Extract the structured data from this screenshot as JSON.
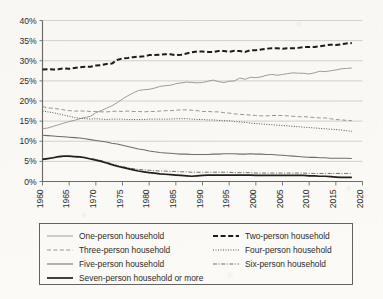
{
  "chart_data": {
    "type": "line",
    "title": "",
    "subtitle": "",
    "xlabel": "",
    "ylabel": "",
    "xlim": [
      1960,
      2020
    ],
    "ylim": [
      0,
      40
    ],
    "grid": true,
    "legend_position": "bottom",
    "y_tick_labels": [
      "0%",
      "5%",
      "10%",
      "15%",
      "20%",
      "25%",
      "30%",
      "35%",
      "40%"
    ],
    "y_tick_values": [
      0,
      5,
      10,
      15,
      20,
      25,
      30,
      35,
      40
    ],
    "x_tick_labels": [
      "1960",
      "1965",
      "1970",
      "1975",
      "1980",
      "1985",
      "1990",
      "1995",
      "2000",
      "2005",
      "2010",
      "2015",
      "2020"
    ],
    "x_tick_values": [
      1960,
      1965,
      1970,
      1975,
      1980,
      1985,
      1990,
      1995,
      2000,
      2005,
      2010,
      2015,
      2020
    ],
    "x": [
      1960,
      1961,
      1962,
      1963,
      1964,
      1965,
      1966,
      1967,
      1968,
      1969,
      1970,
      1971,
      1972,
      1973,
      1974,
      1975,
      1976,
      1977,
      1978,
      1979,
      1980,
      1981,
      1982,
      1983,
      1984,
      1985,
      1986,
      1987,
      1988,
      1989,
      1990,
      1991,
      1992,
      1993,
      1994,
      1995,
      1996,
      1997,
      1998,
      1999,
      2000,
      2001,
      2002,
      2003,
      2004,
      2005,
      2006,
      2007,
      2008,
      2009,
      2010,
      2011,
      2012,
      2013,
      2014,
      2015,
      2016,
      2017,
      2018
    ],
    "series": [
      {
        "name": "One-person household",
        "style": "solid-thin",
        "color": "#8e8c88",
        "values": [
          13.1,
          13.3,
          13.7,
          14.1,
          14.5,
          14.9,
          15.2,
          15.6,
          15.9,
          16.2,
          17.1,
          17.6,
          18.2,
          18.8,
          19.6,
          20.5,
          21.3,
          22.0,
          22.6,
          22.8,
          22.9,
          23.2,
          23.6,
          23.8,
          23.9,
          24.3,
          24.5,
          24.7,
          24.6,
          24.5,
          24.6,
          24.9,
          25.2,
          24.8,
          24.6,
          24.9,
          25.0,
          25.7,
          25.4,
          25.9,
          25.8,
          26.0,
          26.4,
          26.6,
          26.4,
          26.6,
          26.8,
          27.0,
          26.9,
          26.9,
          26.7,
          27.0,
          27.4,
          27.3,
          27.5,
          27.7,
          28.0,
          28.1,
          28.2
        ]
      },
      {
        "name": "Two-person household",
        "style": "dashed-thick",
        "color": "#1e1c1a",
        "values": [
          27.8,
          27.9,
          27.8,
          27.9,
          28.1,
          28.0,
          28.2,
          28.4,
          28.5,
          28.5,
          28.8,
          28.9,
          29.2,
          29.3,
          30.2,
          30.6,
          30.7,
          30.9,
          31.0,
          31.1,
          31.4,
          31.4,
          31.5,
          31.6,
          31.6,
          31.4,
          31.5,
          31.8,
          32.1,
          32.3,
          32.3,
          32.2,
          32.2,
          32.4,
          32.4,
          32.2,
          32.5,
          32.4,
          32.2,
          32.6,
          32.6,
          32.8,
          33.0,
          33.1,
          33.1,
          33.0,
          33.1,
          33.1,
          33.2,
          33.4,
          33.4,
          33.4,
          33.6,
          33.8,
          34.0,
          33.9,
          34.1,
          34.3,
          34.4
        ]
      },
      {
        "name": "Three-person household",
        "style": "dashed-thin",
        "color": "#908e8a",
        "values": [
          18.6,
          18.3,
          18.2,
          18.0,
          17.8,
          17.6,
          17.5,
          17.5,
          17.5,
          17.4,
          17.4,
          17.3,
          17.3,
          17.4,
          17.5,
          17.4,
          17.5,
          17.4,
          17.4,
          17.3,
          17.4,
          17.4,
          17.5,
          17.6,
          17.6,
          17.7,
          17.8,
          17.8,
          17.7,
          17.6,
          17.4,
          17.4,
          17.3,
          17.3,
          17.1,
          17.0,
          16.8,
          16.7,
          16.6,
          16.5,
          16.4,
          16.3,
          16.3,
          16.4,
          16.4,
          16.4,
          16.3,
          16.2,
          16.1,
          16.1,
          16.0,
          15.9,
          15.8,
          15.8,
          15.6,
          15.4,
          15.3,
          15.2,
          15.1
        ]
      },
      {
        "name": "Four-person household",
        "style": "dotted",
        "color": "#565451",
        "values": [
          17.5,
          17.3,
          17.1,
          16.8,
          16.5,
          16.2,
          15.9,
          15.7,
          15.6,
          15.5,
          15.6,
          15.5,
          15.4,
          15.5,
          15.5,
          15.5,
          15.4,
          15.4,
          15.4,
          15.4,
          15.5,
          15.5,
          15.5,
          15.5,
          15.5,
          15.6,
          15.6,
          15.6,
          15.5,
          15.4,
          15.4,
          15.3,
          15.3,
          15.2,
          15.1,
          15.1,
          14.9,
          14.8,
          14.7,
          14.5,
          14.4,
          14.3,
          14.2,
          14.1,
          14.0,
          13.9,
          13.8,
          13.7,
          13.6,
          13.5,
          13.4,
          13.3,
          13.2,
          13.1,
          13.0,
          12.9,
          12.8,
          12.6,
          12.5
        ]
      },
      {
        "name": "Five-person household",
        "style": "solid-medium",
        "color": "#6f6d69",
        "values": [
          11.5,
          11.4,
          11.3,
          11.2,
          11.1,
          11.0,
          10.9,
          10.8,
          10.6,
          10.4,
          10.2,
          10.0,
          9.8,
          9.5,
          9.3,
          9.0,
          8.7,
          8.4,
          8.1,
          7.9,
          7.6,
          7.4,
          7.2,
          7.1,
          7.0,
          6.9,
          6.8,
          6.8,
          6.7,
          6.7,
          6.7,
          6.7,
          6.8,
          6.8,
          6.9,
          6.9,
          6.9,
          6.8,
          6.8,
          6.9,
          6.8,
          6.8,
          6.7,
          6.7,
          6.6,
          6.5,
          6.4,
          6.3,
          6.2,
          6.1,
          6.0,
          6.0,
          5.9,
          5.9,
          5.8,
          5.8,
          5.8,
          5.8,
          5.7
        ]
      },
      {
        "name": "Six-person household",
        "style": "dashdot",
        "color": "#6a6865",
        "values": [
          5.5,
          5.7,
          5.9,
          6.1,
          6.2,
          6.2,
          6.1,
          6.1,
          6.0,
          5.7,
          5.5,
          5.2,
          4.8,
          4.4,
          4.0,
          3.7,
          3.4,
          3.2,
          3.0,
          2.9,
          2.8,
          2.7,
          2.6,
          2.6,
          2.5,
          2.5,
          2.4,
          2.4,
          2.3,
          2.3,
          2.3,
          2.3,
          2.3,
          2.3,
          2.3,
          2.3,
          2.2,
          2.2,
          2.2,
          2.2,
          2.1,
          2.1,
          2.1,
          2.1,
          2.1,
          2.1,
          2.1,
          2.1,
          2.1,
          2.1,
          2.0,
          2.0,
          2.0,
          2.0,
          2.0,
          2.0,
          2.0,
          2.0,
          2.0
        ]
      },
      {
        "name": "Seven-person household or more",
        "style": "solid-thick",
        "color": "#221f1d",
        "values": [
          5.5,
          5.7,
          5.9,
          6.2,
          6.3,
          6.3,
          6.2,
          6.1,
          5.9,
          5.6,
          5.3,
          5.0,
          4.6,
          4.2,
          3.8,
          3.5,
          3.2,
          2.9,
          2.6,
          2.4,
          2.2,
          2.1,
          1.9,
          1.8,
          1.7,
          1.6,
          1.5,
          1.4,
          1.3,
          1.4,
          1.5,
          1.6,
          1.6,
          1.6,
          1.6,
          1.6,
          1.6,
          1.6,
          1.6,
          1.6,
          1.5,
          1.5,
          1.5,
          1.5,
          1.5,
          1.5,
          1.5,
          1.5,
          1.5,
          1.5,
          1.4,
          1.4,
          1.3,
          1.3,
          1.2,
          1.1,
          1.0,
          1.0,
          1.0
        ]
      }
    ]
  },
  "legend": {
    "entries": [
      {
        "label": "One-person household",
        "series_index": 0
      },
      {
        "label": "Two-person household",
        "series_index": 1
      },
      {
        "label": "Three-person household",
        "series_index": 2
      },
      {
        "label": "Four-person household",
        "series_index": 3
      },
      {
        "label": "Five-person household",
        "series_index": 4
      },
      {
        "label": "Six-person household",
        "series_index": 5
      },
      {
        "label": "Seven-person household or more",
        "series_index": 6
      }
    ]
  }
}
